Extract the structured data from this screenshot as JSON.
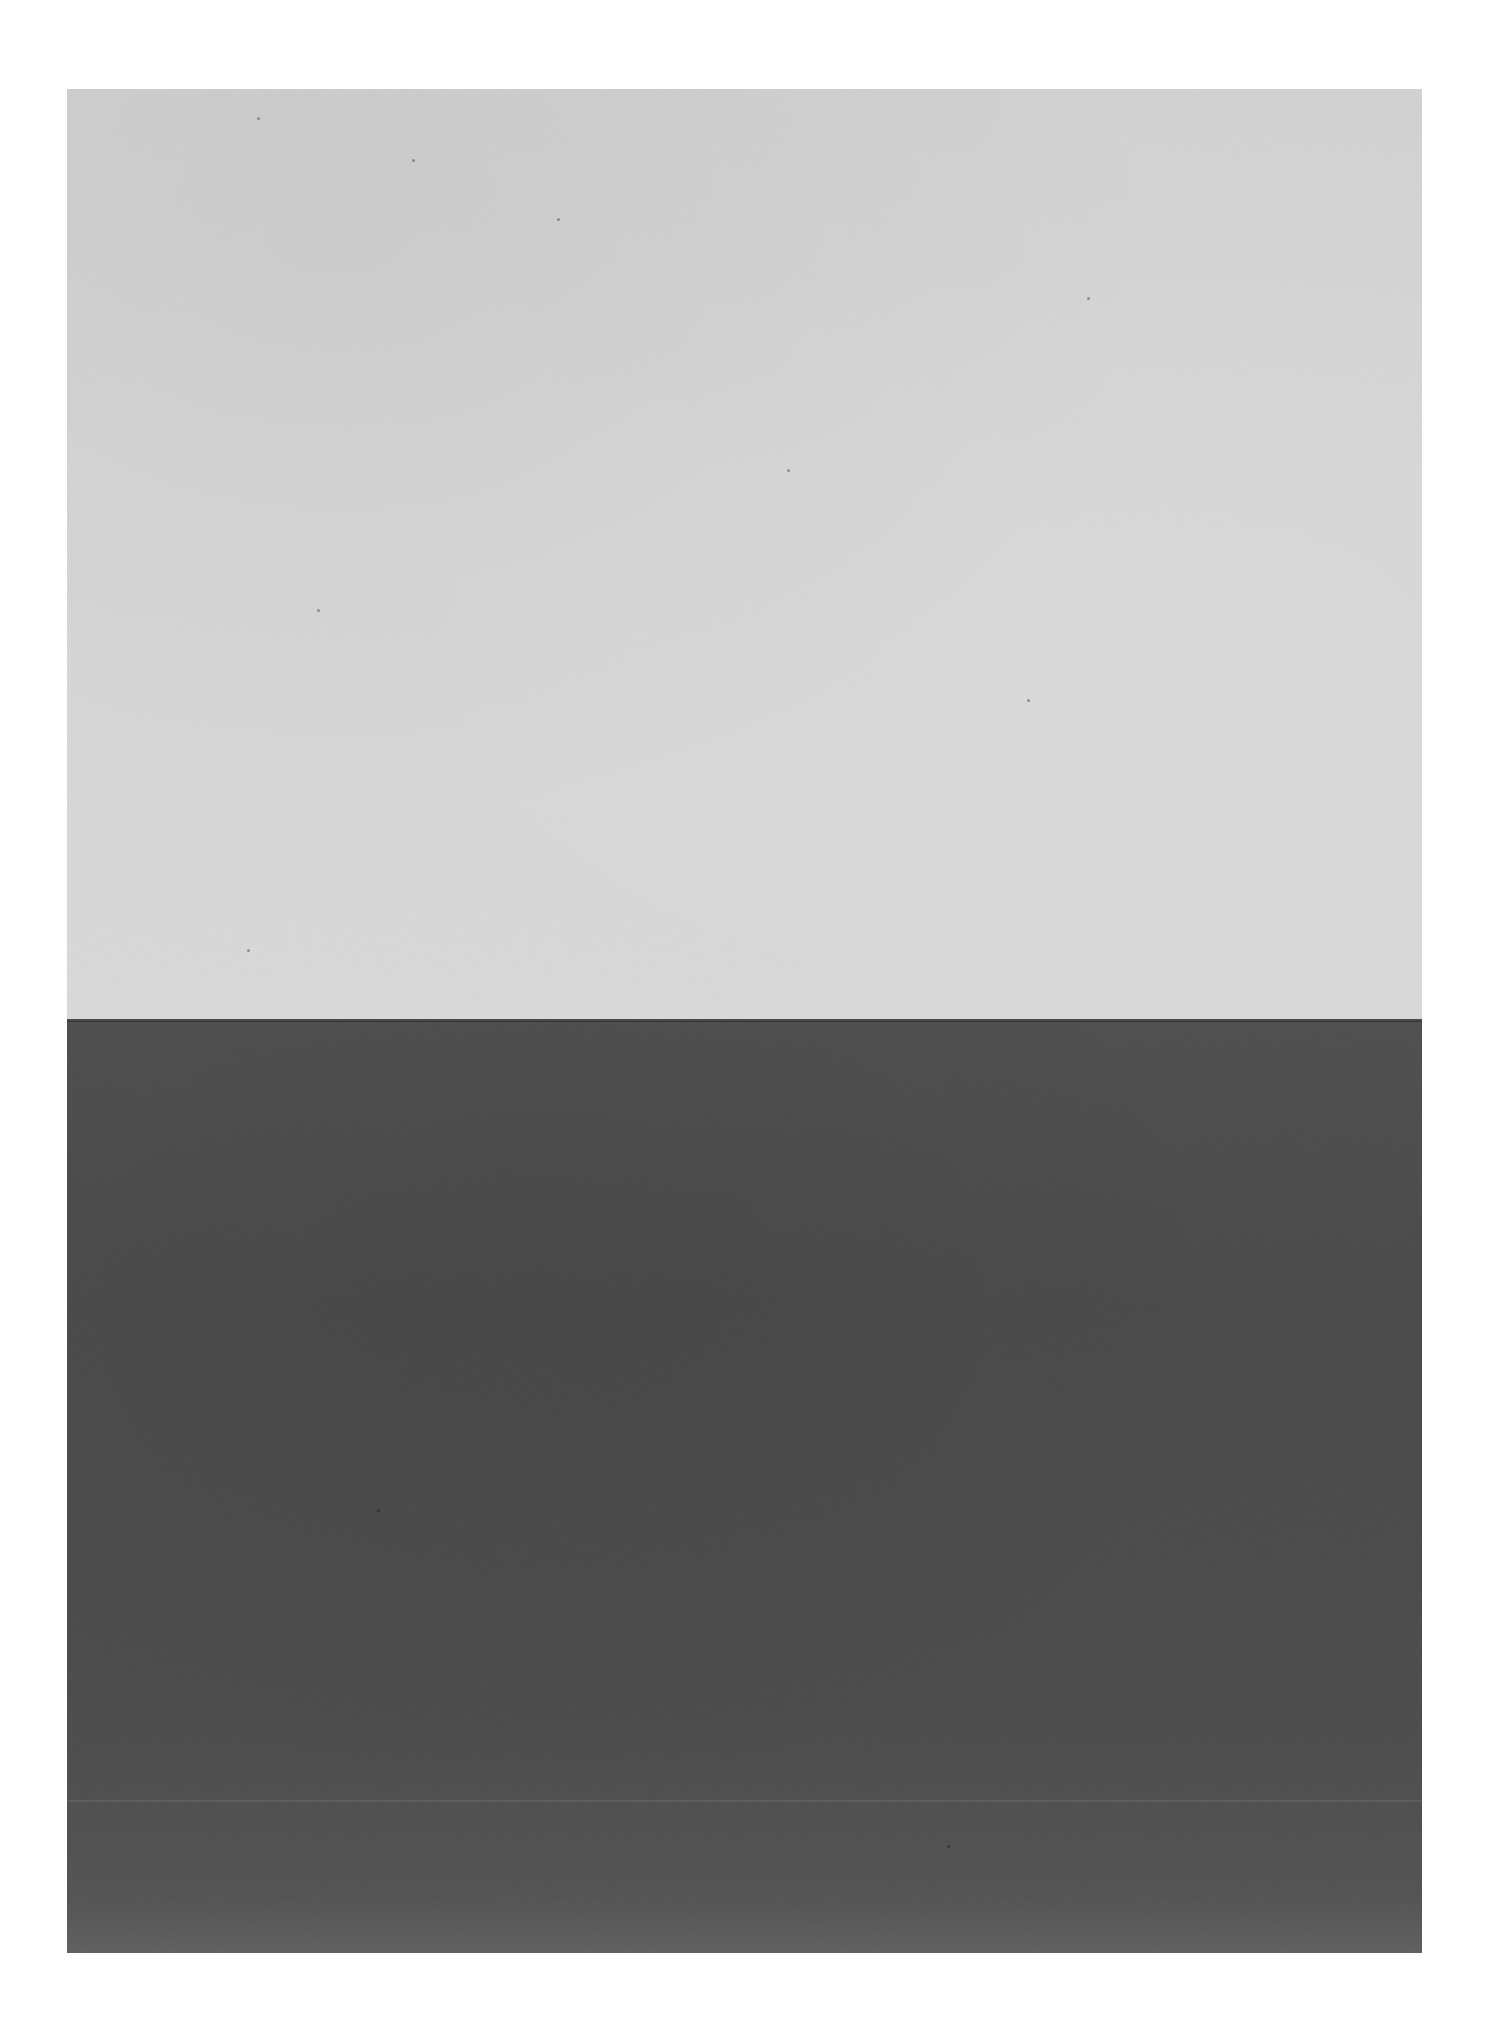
{
  "image": {
    "description": "Two-tone minimalist photograph: a pale gray upper field over a dark charcoal lower field divided by a sharp horizontal line, on a white page margin",
    "colors": {
      "page_background": "#ffffff",
      "upper_field": "#d3d3d3",
      "lower_field": "#4a4a4a",
      "horizon_line": "#2e2e2e"
    },
    "regions": [
      {
        "name": "upper-field",
        "tone": "light gray"
      },
      {
        "name": "lower-field",
        "tone": "dark gray"
      }
    ]
  }
}
